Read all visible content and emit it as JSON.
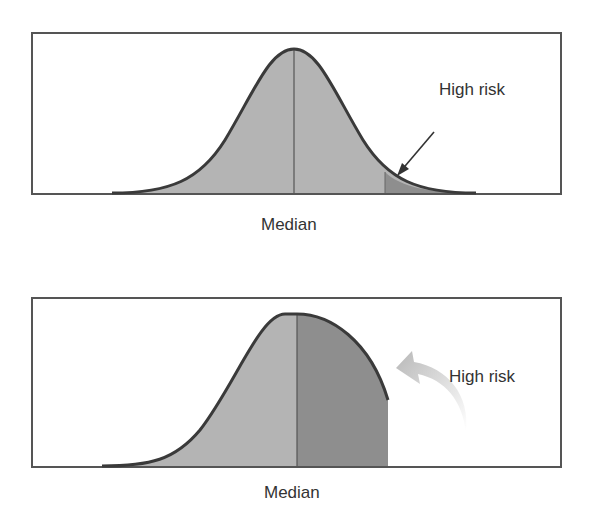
{
  "panels": [
    {
      "id": "normal",
      "median_label": "Median",
      "annotation": "High risk",
      "arrow_style": "straight"
    },
    {
      "id": "skewed",
      "median_label": "Median",
      "annotation": "High risk",
      "arrow_style": "curved-gradient"
    }
  ],
  "colors": {
    "frame": "#555555",
    "curve": "#3a3a3a",
    "fill_light": "#b4b4b4",
    "fill_dark": "#8e8e8e",
    "text": "#333333"
  }
}
